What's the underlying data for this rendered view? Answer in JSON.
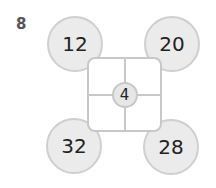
{
  "question_number": "8",
  "center_value": "4",
  "corners": {
    "top_left": "12",
    "top_right": "20",
    "bottom_left": "32",
    "bottom_right": "28"
  },
  "colors": {
    "circle_fill": "#ebebeb",
    "circle_border": "#cfcfcf",
    "grid_line": "#c8c8c8",
    "text": "#222222"
  }
}
